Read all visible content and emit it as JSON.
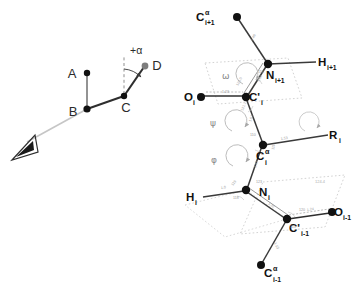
{
  "figure": {
    "title": "",
    "colors": {
      "bond_dark": "#2e2e2e",
      "bond_mid": "#555555",
      "atom_fill": "#111111",
      "atom_gray": "#7d7d7d",
      "plane_dotted": "#c9c9c9",
      "arc_gray": "#a8a8a8",
      "sight_line": "#c0c0c0",
      "text_dark": "#111111",
      "text_gray": "#8a8a8a",
      "micro_text": "#a0a0a0",
      "background": "#ffffff"
    }
  },
  "left_panel": {
    "name": "dihedral-angle-definition",
    "points": [
      {
        "id": "A",
        "label": "A",
        "x": 87,
        "y": 73,
        "style": "dark"
      },
      {
        "id": "B",
        "label": "B",
        "x": 87,
        "y": 109,
        "style": "dark"
      },
      {
        "id": "C",
        "label": "C",
        "x": 124,
        "y": 96,
        "style": "dark"
      },
      {
        "id": "D",
        "label": "D",
        "x": 145,
        "y": 66,
        "style": "gray"
      }
    ],
    "bonds": [
      {
        "from": "A",
        "to": "B",
        "style": "thin-gray"
      },
      {
        "from": "B",
        "to": "C",
        "style": "thick-dark"
      },
      {
        "from": "C",
        "to": "D",
        "style": "thick-dark"
      }
    ],
    "reference_line": {
      "label": "vertical-dashed-reference",
      "from_x": 124,
      "from_y": 96,
      "to_x": 124,
      "to_y": 57
    },
    "angle": {
      "label": "+α",
      "symbol": "+α",
      "sense": "positive-clockwise"
    },
    "sight_line": {
      "label": "viewing-axis",
      "from_x": 87,
      "from_y": 109,
      "to_x": 27,
      "to_y": 143
    },
    "eye": {
      "label": "observer-eye-symbol",
      "x": 22,
      "y": 148
    }
  },
  "right_panel": {
    "name": "polypeptide-backbone-torsion-angles",
    "atoms": [
      {
        "id": "CA_ip1",
        "base": "C",
        "sup": "α",
        "sub": "i+1",
        "x": 237,
        "y": 17,
        "lx": 196,
        "ly": 18,
        "fill": "dark"
      },
      {
        "id": "N_ip1",
        "base": "N",
        "sup": "",
        "sub": "i+1",
        "x": 268,
        "y": 64,
        "lx": 271,
        "ly": 80,
        "fill": "dark"
      },
      {
        "id": "H_ip1",
        "base": "H",
        "sup": "",
        "sub": "i+1",
        "x": 318,
        "y": 62,
        "lx": 320,
        "ly": 66,
        "fill": "none"
      },
      {
        "id": "O_i",
        "base": "O",
        "sup": "",
        "sub": "i",
        "x": 201,
        "y": 97,
        "lx": 185,
        "ly": 101,
        "fill": "dark"
      },
      {
        "id": "CP_i",
        "base": "C'",
        "sup": "",
        "sub": "i",
        "x": 246,
        "y": 97,
        "lx": 250,
        "ly": 101,
        "fill": "dark"
      },
      {
        "id": "CA_i",
        "base": "C",
        "sup": "α",
        "sub": "i",
        "x": 263,
        "y": 145,
        "lx": 258,
        "ly": 160,
        "fill": "dark"
      },
      {
        "id": "R_i",
        "base": "R",
        "sup": "",
        "sub": "i",
        "x": 330,
        "y": 134,
        "lx": 330,
        "ly": 140,
        "fill": "none"
      },
      {
        "id": "N_i",
        "base": "N",
        "sup": "",
        "sub": "i",
        "x": 246,
        "y": 190,
        "lx": 262,
        "ly": 196,
        "fill": "dark"
      },
      {
        "id": "H_i",
        "base": "H",
        "sup": "",
        "sub": "i",
        "x": 199,
        "y": 197,
        "lx": 192,
        "ly": 200,
        "fill": "none"
      },
      {
        "id": "CP_im1",
        "base": "C'",
        "sup": "",
        "sub": "i-1",
        "x": 287,
        "y": 219,
        "lx": 291,
        "ly": 232,
        "fill": "dark"
      },
      {
        "id": "O_im1",
        "base": "O",
        "sup": "",
        "sub": "i-1",
        "x": 332,
        "y": 212,
        "lx": 335,
        "ly": 216,
        "fill": "dark"
      },
      {
        "id": "CA_im1",
        "base": "C",
        "sup": "α",
        "sub": "i-1",
        "x": 261,
        "y": 265,
        "lx": 265,
        "ly": 273,
        "fill": "dark"
      }
    ],
    "bonds": [
      {
        "from": "CA_ip1",
        "to": "N_ip1",
        "order": "single"
      },
      {
        "from": "N_ip1",
        "to": "H_ip1",
        "order": "single"
      },
      {
        "from": "N_ip1",
        "to": "CP_i",
        "order": "partial-double"
      },
      {
        "from": "CP_i",
        "to": "O_i",
        "order": "double"
      },
      {
        "from": "CP_i",
        "to": "CA_i",
        "order": "single"
      },
      {
        "from": "CA_i",
        "to": "R_i",
        "order": "single"
      },
      {
        "from": "CA_i",
        "to": "N_i",
        "order": "single"
      },
      {
        "from": "N_i",
        "to": "H_i",
        "order": "single"
      },
      {
        "from": "N_i",
        "to": "CP_im1",
        "order": "partial-double"
      },
      {
        "from": "CP_im1",
        "to": "O_im1",
        "order": "double"
      },
      {
        "from": "CP_im1",
        "to": "CA_im1",
        "order": "single"
      }
    ],
    "torsion_angles": [
      {
        "id": "omega",
        "symbol": "ω",
        "label": "omega-torsion",
        "x": 225,
        "y": 76,
        "about": "C'_i - N_i+1"
      },
      {
        "id": "psi",
        "symbol": "ψ",
        "label": "psi-torsion",
        "x": 213,
        "y": 123,
        "about": "N_i - Cα_i"
      },
      {
        "id": "phi",
        "symbol": "φ",
        "label": "phi-torsion",
        "x": 214,
        "y": 160,
        "about": "Cα_i - C'_i"
      }
    ],
    "peptide_planes": [
      {
        "id": "plane-upper",
        "label": "peptide-plane-upper"
      },
      {
        "id": "plane-lower",
        "label": "peptide-plane-lower"
      }
    ],
    "measurements": [
      {
        "id": "m1",
        "text": "1.23",
        "x": 222,
        "y": 93,
        "rot": 0
      },
      {
        "id": "m2",
        "text": "123.0",
        "x": 238,
        "y": 86,
        "rot": -62
      },
      {
        "id": "m3",
        "text": "1.32",
        "x": 259,
        "y": 82,
        "rot": -62
      },
      {
        "id": "m4",
        "text": "116",
        "x": 258,
        "y": 73,
        "rot": 0
      },
      {
        "id": "m5",
        "text": "1.46",
        "x": 252,
        "y": 41,
        "rot": -56
      },
      {
        "id": "m6",
        "text": "121.1",
        "x": 243,
        "y": 111,
        "rot": -68
      },
      {
        "id": "m7",
        "text": "1.51",
        "x": 251,
        "y": 122,
        "rot": -70
      },
      {
        "id": "m8",
        "text": "110",
        "x": 250,
        "y": 136,
        "rot": 0
      },
      {
        "id": "m9",
        "text": "111",
        "x": 274,
        "y": 150,
        "rot": -80
      },
      {
        "id": "m10",
        "text": "1.53",
        "x": 281,
        "y": 140,
        "rot": -10
      },
      {
        "id": "m11",
        "text": "1.47",
        "x": 256,
        "y": 168,
        "rot": -72
      },
      {
        "id": "m12",
        "text": "123",
        "x": 256,
        "y": 183,
        "rot": 0
      },
      {
        "id": "m13",
        "text": "1.0",
        "x": 221,
        "y": 189,
        "rot": -8
      },
      {
        "id": "m14",
        "text": "119",
        "x": 233,
        "y": 186,
        "rot": -55
      },
      {
        "id": "m15",
        "text": "118",
        "x": 233,
        "y": 199,
        "rot": 0
      },
      {
        "id": "m16",
        "text": "1.32",
        "x": 268,
        "y": 204,
        "rot": 36
      },
      {
        "id": "m17",
        "text": "1.24",
        "x": 307,
        "y": 211,
        "rot": -8
      },
      {
        "id": "m18",
        "text": "120",
        "x": 299,
        "y": 211,
        "rot": 0
      },
      {
        "id": "m19",
        "text": "115",
        "x": 290,
        "y": 228,
        "rot": 0
      },
      {
        "id": "m20",
        "text": "1.53",
        "x": 274,
        "y": 243,
        "rot": 64
      },
      {
        "id": "m21",
        "text": "124.4",
        "x": 318,
        "y": 181,
        "rot": 0
      }
    ]
  }
}
